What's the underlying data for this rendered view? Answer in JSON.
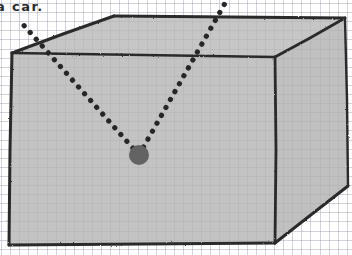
{
  "page": {
    "width": 352,
    "height": 255,
    "medium": "hand-drawn pencil sketch on graph paper",
    "background_color": "#ffffff",
    "grid_line_color": "#8c96a5",
    "grid_spacing_px": 9
  },
  "caption": {
    "text": "a car.",
    "note_truncated_left": true,
    "color": "#2b2b2b"
  },
  "figure": {
    "name": "three-dimensional box drawn in perspective",
    "stroke_color": "#2a2a2a",
    "front_face_fill": "#b4b4b4",
    "top_face_fill": "#b8b8b8",
    "right_face_fill": "#b0b0b0",
    "front_face_points": "12,53 275,57 275,243 9,245",
    "top_face_points": "12,53 114,16 345,18 275,57",
    "right_face_points": "275,57 345,18 348,186 275,243",
    "edges": [
      {
        "name": "front-top-edge",
        "from": [
          12,
          53
        ],
        "to": [
          275,
          57
        ]
      },
      {
        "name": "front-left-edge",
        "from": [
          12,
          53
        ],
        "to": [
          9,
          245
        ]
      },
      {
        "name": "front-bottom-edge",
        "from": [
          9,
          245
        ],
        "to": [
          275,
          243
        ]
      },
      {
        "name": "front-right-edge",
        "from": [
          275,
          57
        ],
        "to": [
          275,
          243
        ]
      },
      {
        "name": "top-left-receding-edge",
        "from": [
          12,
          53
        ],
        "to": [
          114,
          16
        ]
      },
      {
        "name": "top-back-edge",
        "from": [
          114,
          16
        ],
        "to": [
          345,
          18
        ]
      },
      {
        "name": "top-right-receding-edge",
        "from": [
          275,
          57
        ],
        "to": [
          345,
          18
        ]
      },
      {
        "name": "right-back-vertical-edge",
        "from": [
          345,
          18
        ],
        "to": [
          348,
          186
        ]
      },
      {
        "name": "bottom-right-receding-edge",
        "from": [
          275,
          243
        ],
        "to": [
          348,
          186
        ]
      }
    ]
  },
  "point_source": {
    "name": "filled dot marker",
    "center_x": 139,
    "center_y": 155,
    "radius": 10,
    "color": "#636363"
  },
  "rays": [
    {
      "name": "left-dotted-ray",
      "from": [
        139,
        155
      ],
      "to": [
        20,
        21
      ],
      "style": "dotted",
      "dot_radius": 2.6,
      "dot_spacing": 9,
      "color": "#262626"
    },
    {
      "name": "right-dotted-ray",
      "from": [
        139,
        155
      ],
      "to": [
        228,
        -2
      ],
      "style": "dotted",
      "dot_radius": 2.6,
      "dot_spacing": 9,
      "color": "#262626"
    }
  ]
}
